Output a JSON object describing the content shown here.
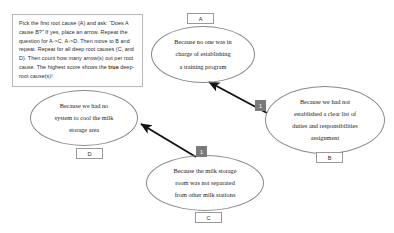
{
  "instruction": {
    "name": "root-cause-instruction",
    "segments": [
      {
        "text": "Pick the first root cause (A) and ask: “Does A cause B?” If yes, place an arrow. Repeat the question for A->C, A->D. Then move to B and repeat. Repeat for all deep root causes (C, and D). Then count how many arrow(s) out per root cause. The highest score shows the ",
        "bold": false
      },
      {
        "text": "true",
        "bold": true
      },
      {
        "text": " deep-root cause(s)!",
        "bold": false
      }
    ]
  },
  "nodes": [
    {
      "id": "A",
      "tag": "A",
      "lines": [
        "Because no one was in",
        "charge of establishing",
        "a training program"
      ]
    },
    {
      "id": "B",
      "tag": "B",
      "lines": [
        "Because we had not",
        "established a clear list of",
        "duties and responsibilities",
        "assignment"
      ]
    },
    {
      "id": "C",
      "tag": "C",
      "lines": [
        "Because the milk storage",
        "room was not separated",
        "from other milk stations"
      ]
    },
    {
      "id": "D",
      "tag": "D",
      "lines": [
        "Because we had no",
        "system to cool the milk",
        "storage area"
      ]
    }
  ],
  "arrows": [
    {
      "name": "arrow-b-to-a",
      "from": "B",
      "to": "A",
      "count": "1"
    },
    {
      "name": "arrow-c-to-d",
      "from": "C",
      "to": "D",
      "count": "1"
    }
  ],
  "colors": {
    "ellipse_stroke": "#8a8a8a",
    "arrow": "#121212",
    "badge_bg": "#7a7a7a",
    "text": "#1a1a1a",
    "box_border": "#b9b9b9"
  }
}
